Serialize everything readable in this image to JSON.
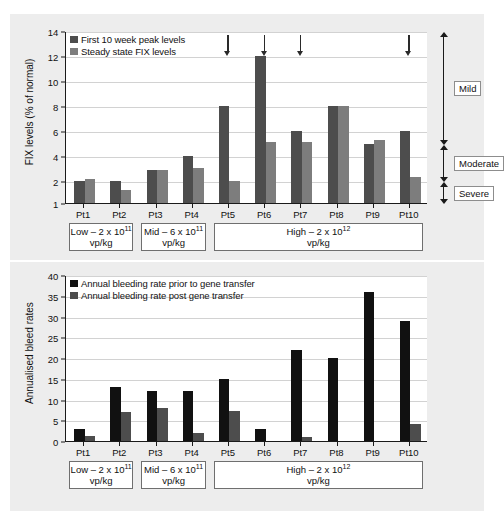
{
  "figure": {
    "background": "#ededed",
    "patients": [
      "Pt1",
      "Pt2",
      "Pt3",
      "Pt4",
      "Pt5",
      "Pt6",
      "Pt7",
      "Pt8",
      "Pt9",
      "Pt10"
    ],
    "dose_groups": [
      {
        "id": "low",
        "line1": "Low – 2 x 10",
        "exp": "11",
        "line2": "vp/kg",
        "start": 0,
        "end": 2
      },
      {
        "id": "mid",
        "line1": "Mid – 6 x 10",
        "exp": "11",
        "line2": "vp/kg",
        "start": 2,
        "end": 4
      },
      {
        "id": "high",
        "line1": "High – 2 x 10",
        "exp": "12",
        "line2": "vp/kg",
        "start": 4,
        "end": 10
      }
    ]
  },
  "chart_data": [
    {
      "id": "fix-levels",
      "type": "bar",
      "title": "",
      "xlabel": "",
      "ylabel": "FIX levels (% of normal)",
      "categories": [
        "Pt1",
        "Pt2",
        "Pt3",
        "Pt4",
        "Pt5",
        "Pt6",
        "Pt7",
        "Pt8",
        "Pt9",
        "Pt10"
      ],
      "yticks": [
        1,
        2,
        4,
        6,
        8,
        10,
        12,
        14
      ],
      "ylim": [
        1,
        14
      ],
      "grid": true,
      "legend_position": "top-left",
      "series": [
        {
          "name": "First 10 week peak levels",
          "color": "#4d4d4d",
          "values": [
            2.0,
            2.0,
            2.9,
            4.0,
            8.0,
            12.0,
            6.0,
            8.0,
            5.0,
            6.0
          ]
        },
        {
          "name": "Steady state FIX levels",
          "color": "#7d7d7d",
          "values": [
            2.15,
            1.6,
            2.9,
            3.05,
            2.0,
            5.1,
            5.1,
            8.0,
            5.3,
            2.3
          ]
        }
      ],
      "annotations": {
        "arrows": {
          "label": "down-arrow",
          "at": [
            "Pt5",
            "Pt6",
            "Pt7",
            "Pt10"
          ]
        },
        "severity_bands": [
          {
            "label": "Mild",
            "from": 5,
            "to": 14
          },
          {
            "label": "Moderate",
            "from": 2,
            "to": 5
          },
          {
            "label": "Severe",
            "from": 1,
            "to": 2
          }
        ]
      }
    },
    {
      "id": "bleed-rates",
      "type": "bar",
      "title": "",
      "xlabel": "",
      "ylabel": "Annualised bleed rates",
      "categories": [
        "Pt1",
        "Pt2",
        "Pt3",
        "Pt4",
        "Pt5",
        "Pt6",
        "Pt7",
        "Pt8",
        "Pt9",
        "Pt10"
      ],
      "yticks": [
        0,
        5,
        10,
        15,
        20,
        25,
        30,
        35,
        40
      ],
      "ylim": [
        0,
        40
      ],
      "grid": true,
      "legend_position": "top-left",
      "series": [
        {
          "name": "Annual bleeding rate prior to gene transfer",
          "color": "#111111",
          "values": [
            3,
            13,
            12,
            12,
            15,
            3,
            22,
            20,
            36,
            29
          ]
        },
        {
          "name": "Annual bleeding rate post gene transfer",
          "color": "#4d4d4d",
          "values": [
            1.3,
            7,
            8,
            2,
            7.2,
            0,
            1,
            0,
            0,
            4
          ]
        }
      ]
    }
  ]
}
